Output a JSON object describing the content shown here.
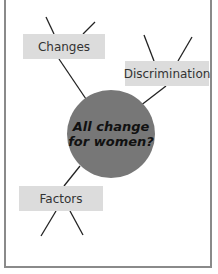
{
  "diagram": {
    "type": "spider-diagram",
    "center": {
      "line1": "All change",
      "line2": "for women?"
    },
    "branches": [
      {
        "label": "Changes"
      },
      {
        "label": "Discrimination"
      },
      {
        "label": "Factors"
      }
    ]
  },
  "colors": {
    "hub": "#777777",
    "box": "#dcdcdc",
    "border": "#8a8a8a"
  }
}
